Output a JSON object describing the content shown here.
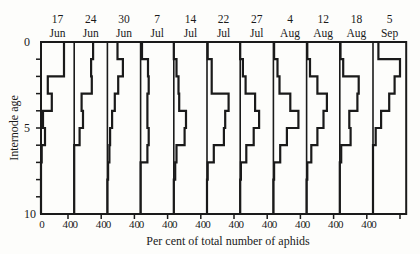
{
  "chart_data": {
    "type": "bar",
    "orientation": "horizontal-step-histogram",
    "title": "",
    "xlabel": "Per cent of total number of aphids",
    "ylabel": "Internode age",
    "ylim": [
      0,
      10
    ],
    "y_ticks": [
      0,
      5,
      10
    ],
    "x_tick_labels_per_panel": [
      "0",
      "40"
    ],
    "xlim_per_panel": [
      0,
      40
    ],
    "grid": false,
    "legend": null,
    "categories": [
      "0-1",
      "1-2",
      "2-3",
      "3-4",
      "4-5",
      "5-6",
      "6-7",
      "7-8",
      "8-9",
      "9-10"
    ],
    "panels": [
      {
        "date_day": "17",
        "date_month": "Jun",
        "values": [
          34,
          34,
          10,
          16,
          3,
          6,
          1,
          0,
          0,
          0
        ]
      },
      {
        "date_day": "24",
        "date_month": "Jun",
        "values": [
          28,
          25,
          26,
          11,
          13,
          8,
          0,
          0,
          0,
          0
        ]
      },
      {
        "date_day": "30",
        "date_month": "Jun",
        "values": [
          15,
          23,
          16,
          11,
          7,
          4,
          3,
          1,
          0,
          0
        ]
      },
      {
        "date_day": "7",
        "date_month": "Jul",
        "values": [
          2,
          11,
          12,
          10,
          10,
          12,
          10,
          0,
          0,
          0
        ]
      },
      {
        "date_day": "14",
        "date_month": "Jul",
        "values": [
          0,
          4,
          7,
          8,
          18,
          16,
          4,
          2,
          0,
          0
        ]
      },
      {
        "date_day": "22",
        "date_month": "Jul",
        "values": [
          1,
          7,
          7,
          32,
          27,
          25,
          10,
          1,
          0,
          0
        ]
      },
      {
        "date_day": "27",
        "date_month": "Jul",
        "values": [
          0,
          4,
          8,
          22,
          28,
          20,
          9,
          1,
          0,
          0
        ]
      },
      {
        "date_day": "4",
        "date_month": "Aug",
        "values": [
          1,
          6,
          9,
          25,
          37,
          20,
          10,
          1,
          0,
          0
        ]
      },
      {
        "date_day": "12",
        "date_month": "Aug",
        "values": [
          1,
          5,
          16,
          30,
          25,
          16,
          7,
          1,
          0,
          0
        ]
      },
      {
        "date_day": "18",
        "date_month": "Aug",
        "values": [
          1,
          5,
          28,
          26,
          14,
          16,
          2,
          0,
          0,
          0
        ]
      },
      {
        "date_day": "5",
        "date_month": "Sep",
        "values": [
          8,
          40,
          32,
          24,
          12,
          4,
          0,
          0,
          0,
          0
        ]
      }
    ]
  },
  "axis": {
    "y_label": "Internode age",
    "y_tick_0": "0",
    "y_tick_5": "5",
    "y_tick_10": "10",
    "x_title": "Per cent of total number of aphids",
    "x_tick_zero": "0",
    "x_tick_forty": "40"
  }
}
